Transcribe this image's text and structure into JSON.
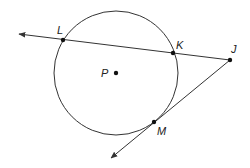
{
  "diagram": {
    "type": "geometry",
    "circle": {
      "name": "P",
      "cx": 116,
      "cy": 73,
      "r": 62
    },
    "points": [
      {
        "id": "L",
        "label": "L",
        "x": 63,
        "y": 40,
        "label_x": 57,
        "label_y": 34
      },
      {
        "id": "K",
        "label": "K",
        "x": 173,
        "y": 53,
        "label_x": 176,
        "label_y": 49
      },
      {
        "id": "J",
        "label": "J",
        "x": 230,
        "y": 60,
        "label_x": 231,
        "label_y": 53
      },
      {
        "id": "P",
        "label": "P",
        "x": 116,
        "y": 73,
        "label_x": 101,
        "label_y": 77
      },
      {
        "id": "M",
        "label": "M",
        "x": 154,
        "y": 122,
        "label_x": 157,
        "label_y": 135
      }
    ],
    "rays": [
      {
        "name": "secant-JL",
        "from": "J",
        "through": "L",
        "x1": 230,
        "y1": 60,
        "x2": 19,
        "y2": 34
      },
      {
        "name": "tangent-JM",
        "from": "J",
        "through": "M",
        "x1": 230,
        "y1": 60,
        "x2": 111,
        "y2": 158
      }
    ],
    "colors": {
      "stroke": "#333333",
      "point": "#111111"
    }
  }
}
